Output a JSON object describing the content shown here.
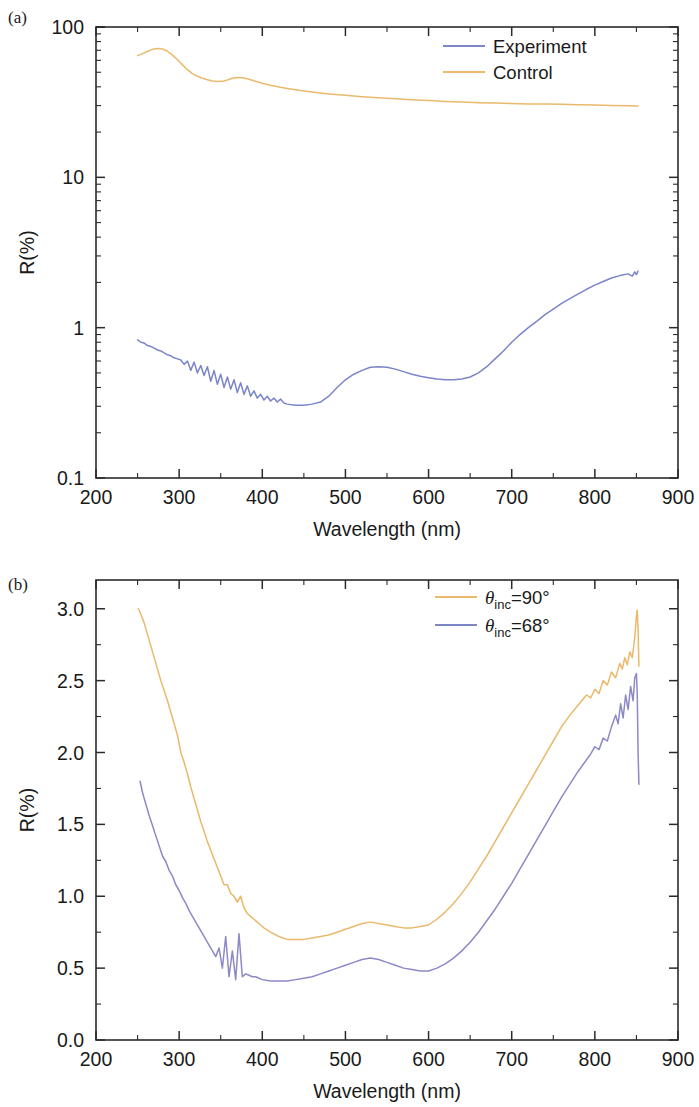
{
  "figure": {
    "panels": [
      {
        "id": "a",
        "label": "(a)",
        "xlabel": "Wavelength (nm)",
        "ylabel": "R(%)",
        "xticks": [
          "200",
          "300",
          "400",
          "500",
          "600",
          "700",
          "800",
          "900"
        ],
        "yticks": [
          "0.1",
          "1",
          "10",
          "100"
        ],
        "legend": [
          {
            "name": "experiment",
            "label": "Experiment",
            "color": "#7b85c8"
          },
          {
            "name": "control",
            "label": "Control",
            "color": "#eab96b"
          }
        ]
      },
      {
        "id": "b",
        "label": "(b)",
        "xlabel": "Wavelength (nm)",
        "ylabel": "R(%)",
        "xticks": [
          "200",
          "300",
          "400",
          "500",
          "600",
          "700",
          "800",
          "900"
        ],
        "yticks": [
          "0.0",
          "0.5",
          "1.0",
          "1.5",
          "2.0",
          "2.5",
          "3.0"
        ],
        "legend": [
          {
            "name": "theta-90",
            "theta": "θ",
            "sub": "inc",
            "eq": "=90°",
            "color": "#eab96b"
          },
          {
            "name": "theta-68",
            "theta": "θ",
            "sub": "inc",
            "eq": "=68°",
            "color": "#7b85c8"
          }
        ]
      }
    ]
  },
  "chart_data": [
    {
      "type": "line",
      "panel": "(a)",
      "title": "",
      "xlabel": "Wavelength (nm)",
      "ylabel": "R(%)",
      "xlim": [
        200,
        900
      ],
      "ylim": [
        0.1,
        100
      ],
      "yscale": "log",
      "xscale": "linear",
      "grid": false,
      "legend_position": "top-right",
      "xticks": [
        200,
        300,
        400,
        500,
        600,
        700,
        800,
        900
      ],
      "yticks": [
        0.1,
        1,
        10,
        100
      ],
      "series": [
        {
          "name": "Control",
          "color": "#eab96b",
          "x": [
            250,
            256,
            262,
            268,
            274,
            280,
            286,
            292,
            298,
            304,
            310,
            316,
            322,
            328,
            334,
            340,
            346,
            352,
            358,
            364,
            370,
            376,
            382,
            388,
            394,
            400,
            410,
            420,
            430,
            440,
            450,
            460,
            470,
            480,
            500,
            520,
            540,
            560,
            580,
            600,
            620,
            640,
            660,
            680,
            700,
            720,
            740,
            760,
            780,
            800,
            820,
            840,
            852
          ],
          "y": [
            64.5,
            66.5,
            69.0,
            71.0,
            72.0,
            71.5,
            69.0,
            65.0,
            60.5,
            56.0,
            52.0,
            49.0,
            47.0,
            45.6,
            44.6,
            43.8,
            43.4,
            43.5,
            44.4,
            45.6,
            46.2,
            46.0,
            45.2,
            44.2,
            43.2,
            42.3,
            41.0,
            39.9,
            39.0,
            38.2,
            37.5,
            36.9,
            36.4,
            35.9,
            35.1,
            34.4,
            33.8,
            33.3,
            32.8,
            32.4,
            32.0,
            31.7,
            31.4,
            31.2,
            31.0,
            30.8,
            30.7,
            30.6,
            30.4,
            30.3,
            30.1,
            29.9,
            29.8
          ]
        },
        {
          "name": "Experiment",
          "color": "#7b85c8",
          "x": [
            250,
            254,
            258,
            262,
            266,
            270,
            274,
            278,
            282,
            286,
            290,
            294,
            298,
            302,
            306,
            310,
            314,
            318,
            322,
            326,
            330,
            334,
            338,
            342,
            346,
            350,
            354,
            358,
            362,
            366,
            370,
            374,
            378,
            382,
            386,
            390,
            394,
            398,
            402,
            406,
            410,
            414,
            418,
            422,
            426,
            430,
            440,
            450,
            460,
            470,
            480,
            490,
            500,
            510,
            520,
            530,
            540,
            550,
            560,
            570,
            580,
            590,
            600,
            610,
            620,
            630,
            640,
            650,
            660,
            670,
            680,
            690,
            700,
            710,
            720,
            730,
            740,
            750,
            760,
            770,
            780,
            790,
            800,
            810,
            820,
            830,
            840,
            845,
            848,
            850,
            852
          ],
          "y": [
            0.83,
            0.8,
            0.79,
            0.76,
            0.75,
            0.73,
            0.71,
            0.7,
            0.68,
            0.66,
            0.65,
            0.63,
            0.62,
            0.61,
            0.57,
            0.6,
            0.52,
            0.59,
            0.5,
            0.56,
            0.48,
            0.55,
            0.44,
            0.52,
            0.42,
            0.49,
            0.4,
            0.47,
            0.39,
            0.45,
            0.37,
            0.43,
            0.36,
            0.41,
            0.35,
            0.38,
            0.34,
            0.36,
            0.33,
            0.35,
            0.325,
            0.34,
            0.32,
            0.335,
            0.315,
            0.31,
            0.305,
            0.305,
            0.31,
            0.32,
            0.35,
            0.4,
            0.45,
            0.49,
            0.52,
            0.545,
            0.55,
            0.545,
            0.53,
            0.51,
            0.49,
            0.475,
            0.465,
            0.455,
            0.45,
            0.45,
            0.455,
            0.47,
            0.5,
            0.55,
            0.62,
            0.7,
            0.8,
            0.9,
            1.0,
            1.1,
            1.22,
            1.33,
            1.45,
            1.56,
            1.68,
            1.8,
            1.92,
            2.03,
            2.14,
            2.22,
            2.28,
            2.2,
            2.35,
            2.25,
            2.38
          ]
        }
      ]
    },
    {
      "type": "line",
      "panel": "(b)",
      "title": "",
      "xlabel": "Wavelength (nm)",
      "ylabel": "R(%)",
      "xlim": [
        200,
        900
      ],
      "ylim": [
        0.0,
        3.2
      ],
      "yscale": "linear",
      "xscale": "linear",
      "grid": false,
      "legend_position": "top-right",
      "xticks": [
        200,
        300,
        400,
        500,
        600,
        700,
        800,
        900
      ],
      "yticks": [
        0.0,
        0.5,
        1.0,
        1.5,
        2.0,
        2.5,
        3.0
      ],
      "series": [
        {
          "name": "θinc=90°",
          "color": "#eab96b",
          "x": [
            251,
            254,
            258,
            262,
            266,
            270,
            274,
            278,
            282,
            286,
            290,
            294,
            298,
            302,
            306,
            310,
            314,
            318,
            322,
            326,
            330,
            334,
            338,
            342,
            346,
            350,
            354,
            358,
            362,
            366,
            370,
            374,
            378,
            382,
            386,
            390,
            394,
            398,
            402,
            410,
            420,
            430,
            440,
            450,
            460,
            470,
            480,
            490,
            500,
            510,
            520,
            530,
            540,
            550,
            560,
            570,
            580,
            590,
            600,
            610,
            620,
            630,
            640,
            650,
            660,
            670,
            680,
            690,
            700,
            710,
            720,
            730,
            740,
            750,
            760,
            770,
            780,
            790,
            795,
            800,
            805,
            810,
            815,
            820,
            825,
            830,
            833,
            836,
            839,
            842,
            845,
            848,
            850,
            851,
            852,
            853
          ],
          "y": [
            3.0,
            2.96,
            2.9,
            2.82,
            2.74,
            2.66,
            2.58,
            2.5,
            2.43,
            2.36,
            2.28,
            2.2,
            2.12,
            2.0,
            1.93,
            1.85,
            1.76,
            1.68,
            1.6,
            1.52,
            1.45,
            1.38,
            1.32,
            1.26,
            1.2,
            1.14,
            1.08,
            1.08,
            1.02,
            1.0,
            0.96,
            1.0,
            0.92,
            0.88,
            0.86,
            0.84,
            0.82,
            0.8,
            0.78,
            0.75,
            0.72,
            0.7,
            0.7,
            0.7,
            0.71,
            0.72,
            0.73,
            0.75,
            0.77,
            0.79,
            0.81,
            0.82,
            0.81,
            0.8,
            0.79,
            0.78,
            0.78,
            0.79,
            0.8,
            0.84,
            0.89,
            0.95,
            1.02,
            1.1,
            1.19,
            1.28,
            1.38,
            1.48,
            1.58,
            1.68,
            1.78,
            1.88,
            1.98,
            2.08,
            2.18,
            2.26,
            2.33,
            2.4,
            2.38,
            2.44,
            2.41,
            2.5,
            2.47,
            2.56,
            2.52,
            2.62,
            2.58,
            2.66,
            2.61,
            2.7,
            2.66,
            2.8,
            2.95,
            2.99,
            2.85,
            2.6
          ]
        },
        {
          "name": "θinc=68°",
          "color": "#8d89c8",
          "x": [
            253,
            256,
            260,
            264,
            268,
            272,
            276,
            280,
            284,
            288,
            292,
            296,
            300,
            304,
            308,
            312,
            316,
            320,
            324,
            328,
            332,
            336,
            340,
            344,
            348,
            352,
            356,
            360,
            364,
            368,
            372,
            376,
            380,
            384,
            388,
            392,
            396,
            400,
            410,
            420,
            430,
            440,
            450,
            460,
            470,
            480,
            490,
            500,
            510,
            520,
            530,
            540,
            550,
            560,
            570,
            580,
            590,
            600,
            610,
            620,
            630,
            640,
            650,
            660,
            670,
            680,
            690,
            700,
            710,
            720,
            730,
            740,
            750,
            760,
            770,
            780,
            790,
            795,
            800,
            805,
            810,
            815,
            820,
            825,
            828,
            831,
            834,
            837,
            840,
            843,
            846,
            848,
            850,
            851,
            852,
            853
          ],
          "y": [
            1.8,
            1.72,
            1.64,
            1.56,
            1.49,
            1.42,
            1.35,
            1.28,
            1.24,
            1.18,
            1.14,
            1.08,
            1.04,
            0.99,
            0.95,
            0.9,
            0.86,
            0.82,
            0.78,
            0.74,
            0.7,
            0.66,
            0.62,
            0.58,
            0.64,
            0.5,
            0.72,
            0.44,
            0.62,
            0.42,
            0.74,
            0.44,
            0.46,
            0.45,
            0.44,
            0.44,
            0.43,
            0.42,
            0.41,
            0.41,
            0.41,
            0.42,
            0.43,
            0.44,
            0.46,
            0.48,
            0.5,
            0.52,
            0.54,
            0.56,
            0.57,
            0.56,
            0.54,
            0.52,
            0.5,
            0.49,
            0.48,
            0.48,
            0.5,
            0.53,
            0.57,
            0.62,
            0.68,
            0.75,
            0.83,
            0.91,
            1.0,
            1.09,
            1.19,
            1.29,
            1.39,
            1.49,
            1.59,
            1.69,
            1.78,
            1.87,
            1.95,
            1.99,
            2.04,
            2.02,
            2.1,
            2.08,
            2.18,
            2.26,
            2.2,
            2.34,
            2.24,
            2.4,
            2.3,
            2.46,
            2.36,
            2.52,
            2.55,
            2.4,
            2.0,
            1.78
          ]
        }
      ]
    }
  ]
}
